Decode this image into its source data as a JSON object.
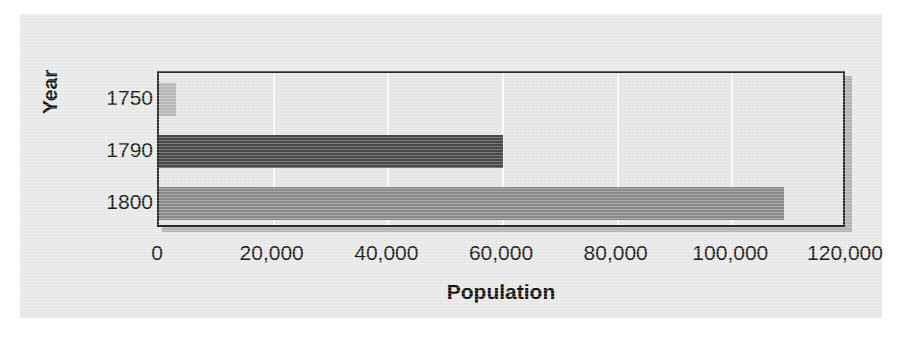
{
  "chart_data": {
    "type": "bar",
    "orientation": "horizontal",
    "title": "",
    "xlabel": "Population",
    "ylabel": "Year",
    "categories": [
      "1750",
      "1790",
      "1800"
    ],
    "values": [
      3000,
      60000,
      109000
    ],
    "series": [
      {
        "name": "Population",
        "values": [
          3000,
          60000,
          109000
        ]
      }
    ],
    "xlim": [
      0,
      120000
    ],
    "xticks": [
      0,
      20000,
      40000,
      60000,
      80000,
      100000,
      120000
    ],
    "xtick_labels": [
      "0",
      "20,000",
      "40,000",
      "60,000",
      "80,000",
      "100,000",
      "120,000"
    ],
    "ytick_labels": [
      "1750",
      "1790",
      "1800"
    ],
    "grid": "vertical",
    "gridline_color": "#fbfbfb",
    "legend": "none",
    "bar_colors": [
      "#b9b9b9",
      "#4a4a4a",
      "#8a8a8a"
    ],
    "plot_background": "#e6e6e6",
    "chart_background": "#e9e9e9",
    "border_color": "#2a2a2a",
    "text_color": "#1b1b1b"
  }
}
